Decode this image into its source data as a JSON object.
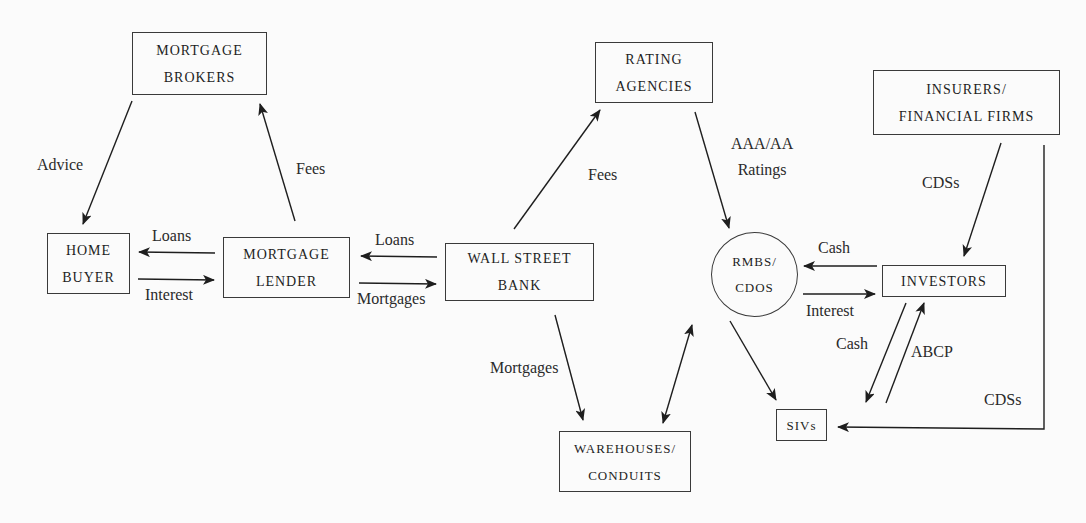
{
  "diagram": {
    "nodes": {
      "mortgage_brokers": {
        "line1": "MORTGAGE",
        "line2": "BROKERS"
      },
      "home_buyer": {
        "line1": "HOME",
        "line2": "BUYER"
      },
      "mortgage_lender": {
        "line1": "MORTGAGE",
        "line2": "LENDER"
      },
      "wall_street_bank": {
        "line1": "WALL STREET",
        "line2": "BANK"
      },
      "rating_agencies": {
        "line1": "RATING",
        "line2": "AGENCIES"
      },
      "insurers": {
        "line1": "INSURERS/",
        "line2": "FINANCIAL FIRMS"
      },
      "rmbs_cdos": {
        "line1": "RMBS/",
        "line2": "CDOs"
      },
      "investors": {
        "line1": "INVESTORS"
      },
      "sivs": {
        "line1": "SIVs"
      },
      "warehouses": {
        "line1": "WAREHOUSES/",
        "line2": "CONDUITS"
      }
    },
    "edges": {
      "brokers_to_buyer": "Advice",
      "lender_to_brokers": "Fees",
      "lender_to_buyer": "Loans",
      "buyer_to_lender": "Interest",
      "bank_to_lender": "Loans",
      "lender_to_bank": "Mortgages",
      "bank_to_rating": "Fees",
      "rating_to_rmbs_line1": "AAA/AA",
      "rating_to_rmbs_line2": "Ratings",
      "bank_to_warehouses": "Mortgages",
      "insurers_to_investors": "CDSs",
      "investors_to_rmbs": "Cash",
      "rmbs_to_investors": "Interest",
      "investors_to_sivs": "Cash",
      "sivs_to_investors": "ABCP",
      "insurers_to_sivs": "CDSs"
    }
  }
}
